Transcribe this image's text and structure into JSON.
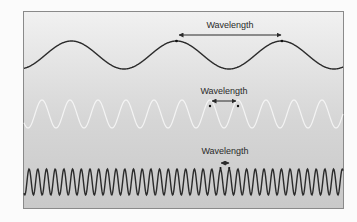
{
  "diagram": {
    "type": "wave-comparison",
    "background_gradient": [
      "#f1f1f1",
      "#c9c9c9"
    ],
    "waves": [
      {
        "name": "long-wavelength",
        "color": "#2b2b2b",
        "label": "Wavelength",
        "amplitude_px": 14,
        "period_px": 105,
        "center_y": 55
      },
      {
        "name": "medium-wavelength",
        "color": "#f4f4f4",
        "label": "Wavelength",
        "amplitude_px": 14,
        "period_px": 28,
        "center_y": 114
      },
      {
        "name": "short-wavelength",
        "color": "#2b2b2b",
        "label": "Wavelength",
        "amplitude_px": 13,
        "period_px": 8.7,
        "center_y": 182
      }
    ]
  }
}
